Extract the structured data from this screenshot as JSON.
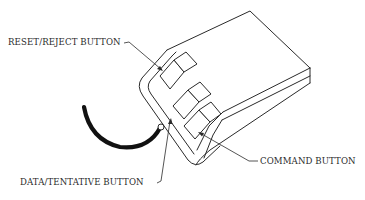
{
  "figure": {
    "labels": {
      "reset_reject": "RESET/REJECT BUTTON",
      "data_tentative": "DATA/TENTATIVE BUTTON",
      "command": "COMMAND BUTTON"
    },
    "colors": {
      "line": "#2a2a2a",
      "cord": "#111111",
      "background": "#ffffff"
    }
  }
}
